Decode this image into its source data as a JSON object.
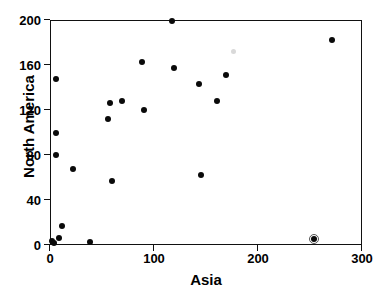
{
  "chart_data": {
    "type": "scatter",
    "title": "",
    "xlabel": "Asia",
    "ylabel": "North America",
    "xlim": [
      0,
      300
    ],
    "ylim": [
      0,
      200
    ],
    "xticks": [
      0,
      100,
      200,
      300
    ],
    "yticks": [
      0,
      40,
      80,
      120,
      160,
      200
    ],
    "xtick_labels": [
      "0",
      "100",
      "200",
      "300"
    ],
    "ytick_labels": [
      "0",
      "40",
      "80",
      "120",
      "160",
      "200"
    ],
    "grid": false,
    "legend": null,
    "marker": "filled-circle",
    "marker_color": "#0a0a0a",
    "points": [
      {
        "x": 2,
        "y": 4,
        "style": "normal"
      },
      {
        "x": 4,
        "y": 2,
        "style": "normal"
      },
      {
        "x": 6,
        "y": 148,
        "style": "normal"
      },
      {
        "x": 6,
        "y": 100,
        "style": "normal"
      },
      {
        "x": 6,
        "y": 80,
        "style": "normal"
      },
      {
        "x": 9,
        "y": 6,
        "style": "normal"
      },
      {
        "x": 12,
        "y": 17,
        "style": "normal"
      },
      {
        "x": 22,
        "y": 68,
        "style": "normal"
      },
      {
        "x": 38,
        "y": 3,
        "style": "normal"
      },
      {
        "x": 56,
        "y": 112,
        "style": "normal"
      },
      {
        "x": 58,
        "y": 126,
        "style": "normal"
      },
      {
        "x": 60,
        "y": 57,
        "style": "normal"
      },
      {
        "x": 69,
        "y": 128,
        "style": "normal"
      },
      {
        "x": 88,
        "y": 163,
        "style": "normal"
      },
      {
        "x": 90,
        "y": 120,
        "style": "normal"
      },
      {
        "x": 117,
        "y": 199,
        "style": "normal"
      },
      {
        "x": 119,
        "y": 157,
        "style": "normal"
      },
      {
        "x": 143,
        "y": 143,
        "style": "normal"
      },
      {
        "x": 145,
        "y": 62,
        "style": "normal"
      },
      {
        "x": 161,
        "y": 128,
        "style": "normal"
      },
      {
        "x": 169,
        "y": 151,
        "style": "normal"
      },
      {
        "x": 176,
        "y": 172,
        "style": "faint"
      },
      {
        "x": 254,
        "y": 5,
        "style": "boxed"
      },
      {
        "x": 271,
        "y": 182,
        "style": "normal"
      }
    ]
  }
}
